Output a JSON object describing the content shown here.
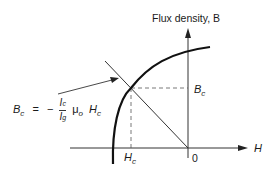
{
  "diagram": {
    "title": "Flux density, B",
    "axes": {
      "x_label": "H",
      "y_label": "Flux density, B",
      "origin_label": "0"
    },
    "points": {
      "operating_point": {
        "H_label": "H",
        "H_sub": "c",
        "B_label": "B",
        "B_sub": "c"
      }
    },
    "equation": {
      "lhs": "B",
      "lhs_sub": "c",
      "equals": "=",
      "minus": "−",
      "numerator": "I",
      "numerator_sub": "c",
      "denominator": "I",
      "denominator_sub": "g",
      "mu": "μ",
      "mu_sub": "o",
      "rhs_var": "H",
      "rhs_sub": "c"
    },
    "elements": [
      "demagnetization curve (second quadrant B-H curve)",
      "load line through origin",
      "dashed projection lines to Hc and Bc",
      "arrow pointing from equation to load line"
    ],
    "colors": {
      "ink": "#1a1a1a",
      "background": "#ffffff"
    }
  }
}
